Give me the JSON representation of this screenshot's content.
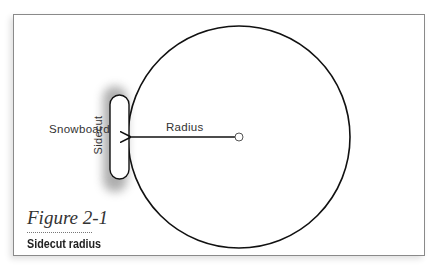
{
  "figure": {
    "number": "Figure 2-1",
    "caption": "Sidecut radius"
  },
  "diagram": {
    "labels": {
      "snowboard": "Snowboard",
      "radius": "Radius",
      "sidecut": "Sidecut"
    },
    "colors": {
      "line": "#111111",
      "frame": "#8a8a8a",
      "shadow": "#9a9a9a"
    }
  }
}
